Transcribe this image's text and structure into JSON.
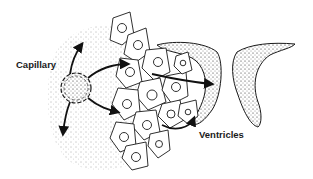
{
  "diagram": {
    "labels": {
      "capillary": "Capillary",
      "ventricles": "Ventricles"
    },
    "colors": {
      "ink": "#1a1a1a",
      "background": "#ffffff"
    }
  }
}
